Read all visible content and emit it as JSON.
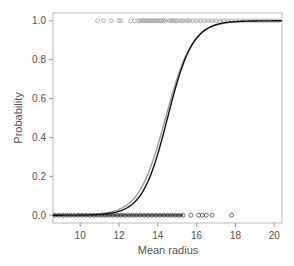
{
  "chart_data": {
    "type": "scatter",
    "title": "",
    "xlabel": "Mean radius",
    "ylabel": "Probability",
    "xlim": [
      8.6,
      20.4
    ],
    "ylim": [
      -0.04,
      1.04
    ],
    "xticks": [
      10,
      12,
      14,
      16,
      18,
      20
    ],
    "yticks": [
      0.0,
      0.2,
      0.4,
      0.6,
      0.8,
      1.0
    ],
    "grid": false,
    "legend": null,
    "series": [
      {
        "name": "observations (class 1)",
        "kind": "points",
        "marker": "open-circle",
        "color": "#999999",
        "y": 1.0,
        "x": [
          10.9,
          11.2,
          11.6,
          12.0,
          12.1,
          12.6,
          12.8,
          13.0,
          13.1,
          13.2,
          13.3,
          13.4,
          13.5,
          13.6,
          13.7,
          13.8,
          13.9,
          14.0,
          14.1,
          14.2,
          14.3,
          14.4,
          14.6,
          14.7,
          14.8,
          14.9,
          15.0,
          15.2,
          15.3,
          15.5,
          15.6,
          15.8,
          16.0,
          16.2,
          16.4,
          16.6,
          16.8,
          17.0,
          17.2,
          17.4,
          17.6,
          17.8,
          18.0,
          18.2,
          18.4,
          18.6,
          18.8,
          19.0,
          19.2,
          19.4,
          19.6,
          19.8,
          20.0,
          20.2
        ]
      },
      {
        "name": "observations (class 0)",
        "kind": "points",
        "marker": "open-circle",
        "color": "#333333",
        "y": 0.0,
        "x": [
          8.7,
          8.9,
          9.1,
          9.3,
          9.5,
          9.7,
          9.9,
          10.1,
          10.3,
          10.5,
          10.7,
          10.9,
          11.1,
          11.3,
          11.5,
          11.7,
          11.9,
          12.1,
          12.3,
          12.5,
          12.7,
          12.9,
          13.1,
          13.3,
          13.5,
          13.7,
          13.9,
          14.1,
          14.3,
          14.5,
          14.7,
          14.9,
          15.1,
          15.3,
          15.7,
          16.1,
          16.3,
          16.5,
          16.8,
          17.8
        ]
      },
      {
        "name": "fitted logistic curve",
        "kind": "line",
        "color": "#111111",
        "midpoint": 14.5,
        "slope": 1.55
      },
      {
        "name": "fitted logistic curve (alt)",
        "kind": "line",
        "color": "#999999",
        "midpoint": 14.4,
        "slope": 1.45
      }
    ]
  }
}
